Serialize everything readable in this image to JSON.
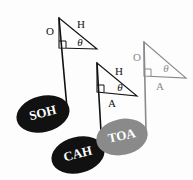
{
  "figure": {
    "background_color": "#fdfdfd",
    "ink_black": "#111111",
    "ink_gray": "#8a8a8a",
    "label_text_color": "#ffffff"
  },
  "notes": [
    {
      "id": "soh",
      "label": "SOH",
      "color": "#111111",
      "head": {
        "cx": 43,
        "cy": 114,
        "rx": 27,
        "ry": 18,
        "rotate": -14
      },
      "label_pos": {
        "x": 43,
        "y": 114
      },
      "label_size": 13,
      "stem": {
        "x1": 67,
        "y1": 108,
        "x2": 59,
        "y2": 18
      },
      "flag": {
        "x1": 59,
        "y1": 18,
        "x2": 67,
        "y2": 108
      }
    },
    {
      "id": "cah",
      "label": "CAH",
      "color": "#111111",
      "head": {
        "cx": 78,
        "cy": 155,
        "rx": 27,
        "ry": 18,
        "rotate": -14
      },
      "label_pos": {
        "x": 78,
        "y": 155
      },
      "label_size": 13,
      "stem": {
        "x1": 102,
        "y1": 149,
        "x2": 97,
        "y2": 63
      },
      "flag": {
        "x1": 97,
        "y1": 63,
        "x2": 102,
        "y2": 149
      }
    },
    {
      "id": "toa",
      "label": "TOA",
      "color": "#8a8a8a",
      "head": {
        "cx": 122,
        "cy": 137,
        "rx": 26,
        "ry": 18,
        "rotate": -12
      },
      "label_pos": {
        "x": 122,
        "y": 137
      },
      "label_size": 13,
      "stem": {
        "x1": 146,
        "y1": 131,
        "x2": 144,
        "y2": 42
      },
      "flag": {
        "x1": 144,
        "y1": 42,
        "x2": 146,
        "y2": 131
      }
    }
  ],
  "triangles": [
    {
      "id": "soh-triangle",
      "color": "#111111",
      "apex": {
        "x": 59,
        "y": 18
      },
      "right_angle": {
        "x": 59,
        "y": 48
      },
      "far": {
        "x": 97,
        "y": 49
      },
      "right_marker": {
        "x": 59,
        "y": 48,
        "size": 7
      },
      "labels": [
        {
          "name": "opposite",
          "text": "O",
          "x": 50,
          "y": 32,
          "size": 11,
          "style": "plain"
        },
        {
          "name": "hypotenuse",
          "text": "H",
          "x": 81,
          "y": 25,
          "size": 11,
          "style": "plain"
        },
        {
          "name": "theta",
          "text": "θ",
          "x": 80,
          "y": 43,
          "size": 11,
          "style": "italic"
        }
      ]
    },
    {
      "id": "cah-triangle",
      "color": "#111111",
      "apex": {
        "x": 97,
        "y": 63
      },
      "right_angle": {
        "x": 97,
        "y": 92
      },
      "far": {
        "x": 137,
        "y": 96
      },
      "right_marker": {
        "x": 97,
        "y": 92,
        "size": 7
      },
      "labels": [
        {
          "name": "hypotenuse",
          "text": "H",
          "x": 119,
          "y": 72,
          "size": 11,
          "style": "plain"
        },
        {
          "name": "theta",
          "text": "θ",
          "x": 120,
          "y": 88,
          "size": 11,
          "style": "italic"
        },
        {
          "name": "adjacent",
          "text": "A",
          "x": 112,
          "y": 104,
          "size": 11,
          "style": "plain"
        }
      ]
    },
    {
      "id": "toa-triangle",
      "color": "#8a8a8a",
      "apex": {
        "x": 144,
        "y": 42
      },
      "right_angle": {
        "x": 144,
        "y": 76
      },
      "far": {
        "x": 186,
        "y": 78
      },
      "right_marker": {
        "x": 144,
        "y": 76,
        "size": 7
      },
      "labels": [
        {
          "name": "opposite",
          "text": "O",
          "x": 137,
          "y": 58,
          "size": 11,
          "style": "plain"
        },
        {
          "name": "theta",
          "text": "θ",
          "x": 166,
          "y": 69,
          "size": 11,
          "style": "italic"
        },
        {
          "name": "adjacent",
          "text": "A",
          "x": 160,
          "y": 87,
          "size": 11,
          "style": "plain"
        }
      ]
    }
  ]
}
